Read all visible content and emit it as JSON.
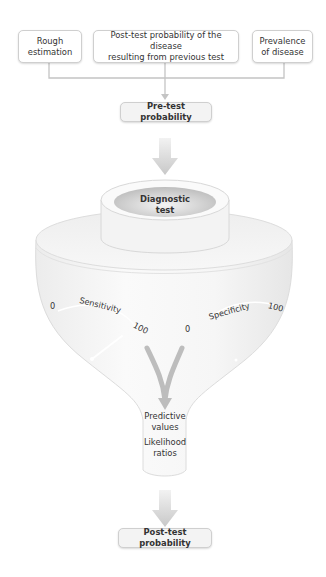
{
  "inputs": [
    {
      "label": "Rough estimation",
      "line1": "Rough",
      "line2": "estimation"
    },
    {
      "label": "Post-test probability of the disease resulting from previous test",
      "line1": "Post-test probability of the disease",
      "line2": "resulting from previous test"
    },
    {
      "label": "Prevalence of disease",
      "line1": "Prevalence",
      "line2": "of disease"
    }
  ],
  "pretest": {
    "label": "Pre-test probability"
  },
  "diagnostic": {
    "line1": "Diagnostic",
    "line2": "test"
  },
  "sensitivity": {
    "label": "Sensitivity",
    "min": "0",
    "max": "100"
  },
  "specificity": {
    "label": "Specificity",
    "min": "0",
    "max": "100"
  },
  "outputs": {
    "predictive_line1": "Predictive",
    "predictive_line2": "values",
    "likelihood_line1": "Likelihood",
    "likelihood_line2": "ratios"
  },
  "posttest": {
    "label": "Post-test probability"
  },
  "colors": {
    "arrow": "#cfcfcf",
    "line": "#c4c4c4",
    "funnel": "#f4f4f4",
    "text": "#333333"
  }
}
